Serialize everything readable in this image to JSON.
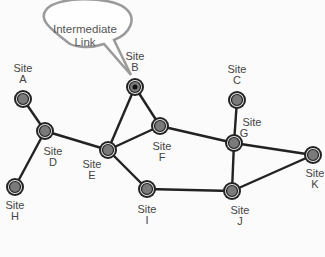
{
  "diagram": {
    "callout": {
      "lines": [
        "Intermediate",
        "Link"
      ],
      "target": "B"
    },
    "nodes": [
      {
        "id": "A",
        "label": [
          "Site",
          "A"
        ],
        "highlight": false
      },
      {
        "id": "B",
        "label": [
          "Site",
          "B"
        ],
        "highlight": true
      },
      {
        "id": "C",
        "label": [
          "Site",
          "C"
        ],
        "highlight": false
      },
      {
        "id": "D",
        "label": [
          "Site",
          "D"
        ],
        "highlight": false
      },
      {
        "id": "E",
        "label": [
          "Site",
          "E"
        ],
        "highlight": false
      },
      {
        "id": "F",
        "label": [
          "Site",
          "F"
        ],
        "highlight": false
      },
      {
        "id": "G",
        "label": [
          "Site",
          "G"
        ],
        "highlight": false
      },
      {
        "id": "H",
        "label": [
          "Site",
          "H"
        ],
        "highlight": false
      },
      {
        "id": "I",
        "label": [
          "Site",
          "I"
        ],
        "highlight": false
      },
      {
        "id": "J",
        "label": [
          "Site",
          "J"
        ],
        "highlight": false
      },
      {
        "id": "K",
        "label": [
          "Site",
          "K"
        ],
        "highlight": false
      }
    ],
    "edges": [
      [
        "A",
        "D"
      ],
      [
        "D",
        "H"
      ],
      [
        "D",
        "E"
      ],
      [
        "E",
        "B"
      ],
      [
        "B",
        "F"
      ],
      [
        "E",
        "F"
      ],
      [
        "E",
        "I"
      ],
      [
        "F",
        "G"
      ],
      [
        "C",
        "G"
      ],
      [
        "G",
        "K"
      ],
      [
        "G",
        "J"
      ],
      [
        "J",
        "K"
      ],
      [
        "I",
        "J"
      ]
    ],
    "colors": {
      "node_fill": "#7a7a7a",
      "node_ring": "#222222",
      "edge": "#222222",
      "bubble_stroke": "#999999",
      "highlight_center": "#111111"
    }
  }
}
